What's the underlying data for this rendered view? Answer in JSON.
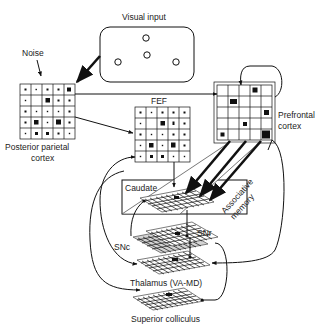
{
  "labels": {
    "visual_input": "Visual input",
    "noise": "Noise",
    "ppc_line1": "Posterior parietal",
    "ppc_line2": "cortex",
    "fef": "FEF",
    "pfc_line1": "Prefrontal",
    "pfc_line2": "cortex",
    "caudate": "Caudate",
    "assoc_line1": "Associative",
    "assoc_line2": "memory",
    "snr": "SNr",
    "snc": "SNc",
    "thalamus": "Thalamus (VA-MD)",
    "superior_colliculus": "Superior colliculus"
  },
  "visual_input": {
    "stimuli": [
      "circle",
      "circle",
      "circle",
      "circle"
    ]
  },
  "nodes": [
    {
      "id": "visual-input",
      "label": "Visual input"
    },
    {
      "id": "posterior-parietal-cortex",
      "label": "Posterior parietal cortex",
      "grid": "5x5"
    },
    {
      "id": "fef",
      "label": "FEF",
      "grid": "5x5"
    },
    {
      "id": "prefrontal-cortex",
      "label": "Prefrontal cortex",
      "grid": "5x5"
    },
    {
      "id": "caudate",
      "label": "Caudate"
    },
    {
      "id": "snr",
      "label": "SNr"
    },
    {
      "id": "snc",
      "label": "SNc"
    },
    {
      "id": "thalamus",
      "label": "Thalamus (VA-MD)"
    },
    {
      "id": "superior-colliculus",
      "label": "Superior colliculus"
    }
  ],
  "edges": [
    {
      "from": "visual-input",
      "to": "posterior-parietal-cortex"
    },
    {
      "from": "noise",
      "to": "posterior-parietal-cortex"
    },
    {
      "from": "posterior-parietal-cortex",
      "to": "fef"
    },
    {
      "from": "posterior-parietal-cortex",
      "to": "prefrontal-cortex"
    },
    {
      "from": "prefrontal-cortex",
      "to": "prefrontal-cortex"
    },
    {
      "from": "prefrontal-cortex",
      "to": "caudate",
      "type": "associative memory"
    },
    {
      "from": "fef",
      "to": "caudate"
    },
    {
      "from": "caudate",
      "to": "snr",
      "type": "inhibitory"
    },
    {
      "from": "snc",
      "to": "caudate",
      "type": "modulatory"
    },
    {
      "from": "snr",
      "to": "thalamus",
      "type": "inhibitory"
    },
    {
      "from": "thalamus",
      "to": "fef"
    },
    {
      "from": "thalamus",
      "to": "prefrontal-cortex"
    },
    {
      "from": "fef",
      "to": "thalamus"
    },
    {
      "from": "fef",
      "to": "superior-colliculus"
    },
    {
      "from": "snr",
      "to": "superior-colliculus",
      "type": "inhibitory"
    }
  ]
}
